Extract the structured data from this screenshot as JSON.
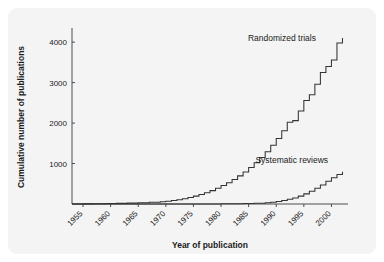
{
  "figure": {
    "background_color": "#f4f4f4",
    "page_color": "#ffffff",
    "line_color": "#333333",
    "axis_color": "#4d4d4d",
    "text_color": "#1a1a1a"
  },
  "chart_data": {
    "type": "line",
    "title": "",
    "subtitle": "",
    "xlabel": "Year of publication",
    "ylabel": "Cumulative number of publications",
    "xlim": [
      1953,
      2003
    ],
    "ylim": [
      0,
      4300
    ],
    "grid": false,
    "legend_position": "inline-annotation",
    "x_ticks": [
      1955,
      1960,
      1965,
      1970,
      1975,
      1980,
      1985,
      1990,
      1995,
      2000
    ],
    "x_tick_labels": [
      "1955",
      "1960",
      "1965",
      "1970",
      "1975",
      "1980",
      "1985",
      "1990",
      "1995",
      "2000"
    ],
    "x_tick_rotation": 45,
    "y_ticks": [
      1000,
      2000,
      3000,
      4000
    ],
    "y_tick_labels": [
      "1000",
      "2000",
      "3000",
      "4000"
    ],
    "step_style": "post",
    "annotations": [
      {
        "text": "Randomized trials",
        "x": 1997.2,
        "y": 4020,
        "anchor": "end"
      },
      {
        "text": "Systematic reviews",
        "x": 1999.4,
        "y": 1020,
        "anchor": "end"
      }
    ],
    "series": [
      {
        "name": "Randomized trials",
        "x": [
          1953,
          1955,
          1957,
          1959,
          1961,
          1963,
          1965,
          1967,
          1969,
          1970,
          1971,
          1972,
          1973,
          1974,
          1975,
          1976,
          1977,
          1978,
          1979,
          1980,
          1981,
          1982,
          1983,
          1984,
          1985,
          1986,
          1987,
          1988,
          1989,
          1990,
          1991,
          1992,
          1993,
          1994,
          1995,
          1996,
          1997,
          1998,
          1999,
          2000,
          2001,
          2002
        ],
        "values": [
          0,
          3,
          6,
          10,
          15,
          22,
          30,
          42,
          58,
          70,
          85,
          105,
          130,
          160,
          195,
          235,
          280,
          330,
          390,
          455,
          525,
          605,
          695,
          790,
          900,
          1020,
          1150,
          1290,
          1450,
          1620,
          1810,
          2020,
          2060,
          2300,
          2560,
          2700,
          2960,
          3250,
          3400,
          3560,
          3980,
          4100
        ]
      },
      {
        "name": "Systematic reviews",
        "x": [
          1953,
          1960,
          1965,
          1970,
          1975,
          1980,
          1984,
          1986,
          1988,
          1989,
          1990,
          1991,
          1992,
          1993,
          1994,
          1995,
          1996,
          1997,
          1998,
          1999,
          2000,
          2001,
          2002
        ],
        "values": [
          0,
          0,
          0,
          0,
          2,
          5,
          10,
          18,
          30,
          45,
          62,
          85,
          115,
          150,
          195,
          250,
          315,
          390,
          470,
          560,
          650,
          730,
          800
        ]
      }
    ]
  }
}
